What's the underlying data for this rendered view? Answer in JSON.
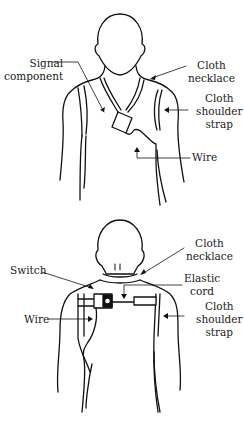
{
  "figures": [
    {
      "name": "top-figure-front-view",
      "labels": {
        "signal_component": [
          "Signal",
          "component"
        ],
        "cloth_necklace": [
          "Cloth",
          "necklace"
        ],
        "cloth_shoulder_strap": [
          "Cloth",
          "shoulder",
          "strap"
        ],
        "wire": [
          "Wire"
        ]
      }
    },
    {
      "name": "bottom-figure-back-view",
      "labels": {
        "cloth_necklace": [
          "Cloth",
          "necklace"
        ],
        "switch": [
          "Switch"
        ],
        "elastic_cord": [
          "Elastic",
          "cord"
        ],
        "wire": [
          "Wire"
        ],
        "cloth_shoulder_strap": [
          "Cloth",
          "shoulder",
          "strap"
        ]
      }
    }
  ],
  "colors": {
    "line": "#111111",
    "background": "#ffffff"
  }
}
